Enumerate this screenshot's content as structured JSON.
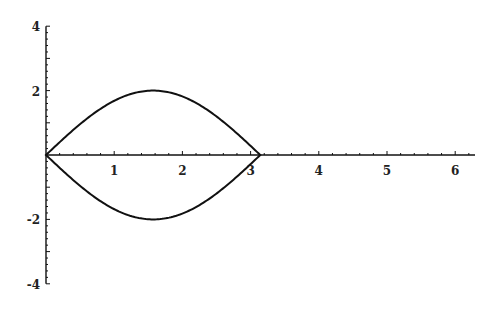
{
  "chart_data": {
    "type": "line",
    "title": "",
    "xlabel": "",
    "ylabel": "",
    "xlim": [
      0,
      6.28
    ],
    "ylim": [
      -4,
      4
    ],
    "grid": false,
    "legend": null,
    "x_ticks": [
      1,
      2,
      3,
      4,
      5,
      6
    ],
    "x_tick_labels": [
      "1",
      "2",
      "3",
      "4",
      "5",
      "6"
    ],
    "y_ticks": [
      -4,
      -2,
      2,
      4
    ],
    "y_tick_labels": [
      "-4",
      "-2",
      "2",
      "4"
    ],
    "minor_tick_step": 0.2,
    "series": [
      {
        "name": "upper branch",
        "x": [
          0,
          0.3927,
          0.7854,
          1.1781,
          1.5708,
          1.9635,
          2.3562,
          2.7489,
          3.1416
        ],
        "y": [
          0,
          0.765,
          1.414,
          1.848,
          2.0,
          1.848,
          1.414,
          0.765,
          0
        ]
      },
      {
        "name": "lower branch",
        "x": [
          0,
          0.3927,
          0.7854,
          1.1781,
          1.5708,
          1.9635,
          2.3562,
          2.7489,
          3.1416
        ],
        "y": [
          0,
          -0.765,
          -1.414,
          -1.848,
          -2.0,
          -1.848,
          -1.414,
          -0.765,
          0
        ]
      }
    ],
    "colors": {
      "curve": "#111111",
      "axis": "#111111",
      "background": "#ffffff"
    }
  },
  "layout": {
    "origin_px": [
      46,
      155
    ],
    "x_px_per_unit": 68.2,
    "y_px_per_unit": 32.2,
    "x_axis_end_px": 475
  }
}
